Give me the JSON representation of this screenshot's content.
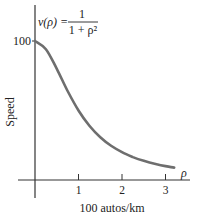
{
  "chart_data": {
    "type": "line",
    "title": "",
    "annotation": {
      "lhs": "v(ρ) =",
      "numerator": "1",
      "denominator": "1 + ρ²"
    },
    "xlabel": "100 autos/km",
    "xaxis_symbol": "ρ",
    "ylabel": "Speed",
    "x_ticks": [
      "1",
      "2",
      "3"
    ],
    "y_ticks": [
      "100"
    ],
    "xlim": [
      0,
      3.3
    ],
    "ylim": [
      0,
      100
    ],
    "grid": false,
    "legend": null,
    "series": [
      {
        "name": "v(ρ) = 1/(1+ρ²)",
        "color": "#6e6e6e",
        "x": [
          0,
          0.25,
          0.5,
          0.75,
          1.0,
          1.25,
          1.5,
          1.75,
          2.0,
          2.25,
          2.5,
          2.75,
          3.0,
          3.2
        ],
        "y": [
          100,
          94.1,
          80.0,
          64.0,
          50.0,
          39.0,
          30.8,
          24.6,
          20.0,
          16.5,
          13.8,
          11.7,
          10.0,
          8.9
        ]
      }
    ]
  }
}
